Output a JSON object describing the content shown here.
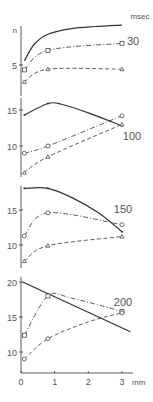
{
  "chart_data": [
    {
      "type": "line",
      "panel_label": "30",
      "unit_label": "msec",
      "ylabel": "n",
      "x": [
        0.1,
        0.8,
        3.0
      ],
      "ylim": [
        2,
        11
      ],
      "yticks": [
        5
      ],
      "series": [
        {
          "name": "solid",
          "style": "solid",
          "marker": "none",
          "x": [
            0.1,
            0.4,
            0.8,
            1.5,
            2.2,
            3.0
          ],
          "values": [
            5.6,
            8.0,
            9.4,
            10.2,
            10.5,
            10.7
          ]
        },
        {
          "name": "dash-dot",
          "style": "dashdot",
          "marker": "square",
          "x": [
            0.1,
            0.8,
            3.0
          ],
          "values": [
            4.3,
            7.1,
            8.1
          ]
        },
        {
          "name": "dashed",
          "style": "dashed",
          "marker": "triangle",
          "x": [
            0.1,
            0.8,
            3.0
          ],
          "values": [
            2.6,
            4.4,
            4.4
          ]
        }
      ]
    },
    {
      "type": "line",
      "panel_label": "100",
      "x": [
        0.1,
        0.8,
        3.0
      ],
      "ylim": [
        5,
        17
      ],
      "yticks": [
        10,
        15
      ],
      "series": [
        {
          "name": "solid",
          "style": "solid",
          "marker": "dot",
          "x": [
            0.1,
            0.8,
            1.2,
            2.0,
            3.0
          ],
          "values": [
            14.3,
            15.9,
            15.8,
            14.6,
            12.8
          ]
        },
        {
          "name": "dash-dot",
          "style": "dashdot",
          "marker": "circle",
          "x": [
            0.1,
            0.8,
            3.0
          ],
          "values": [
            9.0,
            10.0,
            14.2
          ]
        },
        {
          "name": "dashed",
          "style": "dashed",
          "marker": "triangle",
          "x": [
            0.1,
            0.8,
            3.0
          ],
          "values": [
            6.3,
            8.5,
            13.0
          ]
        }
      ]
    },
    {
      "type": "line",
      "panel_label": "150",
      "x": [
        0.1,
        0.8,
        3.0
      ],
      "ylim": [
        7,
        19
      ],
      "yticks": [
        10,
        15
      ],
      "series": [
        {
          "name": "solid",
          "style": "solid",
          "marker": "dot",
          "x": [
            0.1,
            0.8,
            1.5,
            2.3,
            3.0
          ],
          "values": [
            18.1,
            18.1,
            16.8,
            14.6,
            11.9
          ]
        },
        {
          "name": "dash-dot",
          "style": "dashdot",
          "marker": "circle",
          "x": [
            0.1,
            0.8,
            3.0
          ],
          "values": [
            11.3,
            14.6,
            12.9
          ]
        },
        {
          "name": "dashed",
          "style": "dashed",
          "marker": "triangle",
          "x": [
            0.1,
            0.8,
            3.0
          ],
          "values": [
            7.7,
            9.9,
            11.2
          ]
        }
      ]
    },
    {
      "type": "line",
      "panel_label": "200",
      "x": [
        0.1,
        0.8,
        3.0
      ],
      "ylim": [
        7,
        21
      ],
      "yticks": [
        10,
        15,
        20
      ],
      "xlabel": "mm",
      "xticks": [
        0,
        1,
        2,
        3
      ],
      "xlim": [
        0,
        3.3
      ],
      "series": [
        {
          "name": "solid",
          "style": "solid",
          "marker": "none",
          "x": [
            0.05,
            3.25
          ],
          "values": [
            20.0,
            12.9
          ]
        },
        {
          "name": "dash-dot",
          "style": "dashdot",
          "marker": "square",
          "x": [
            0.1,
            0.8,
            1.5,
            3.0
          ],
          "values": [
            12.4,
            18.0,
            17.7,
            15.8
          ]
        },
        {
          "name": "dashed",
          "style": "dashed",
          "marker": "circle",
          "x": [
            0.1,
            0.8,
            2.0,
            3.0
          ],
          "values": [
            9.0,
            11.9,
            14.3,
            15.6
          ]
        }
      ]
    }
  ],
  "labels": {
    "unit": "msec",
    "x_unit": "mm",
    "y_symbol": "n"
  }
}
